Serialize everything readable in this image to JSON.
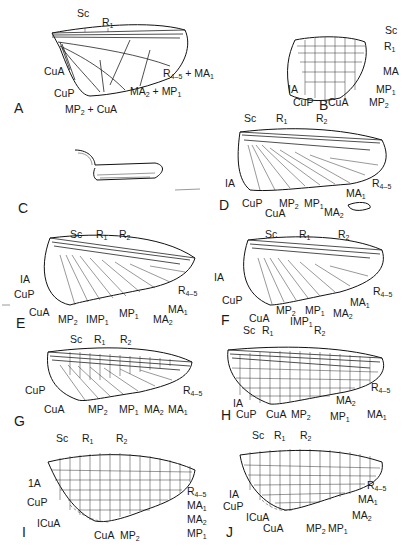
{
  "figure": {
    "panels": [
      {
        "id": "A",
        "letter": "A",
        "labels": [
          "Sc",
          "R1",
          "CuA",
          "CuP",
          "R4-5 + MA1",
          "MA2 + MP1",
          "MP2 + CuA"
        ]
      },
      {
        "id": "B",
        "letter": "B",
        "labels": [
          "Sc",
          "R1",
          "MA",
          "IA",
          "MP1",
          "CuP",
          "CuA",
          "MP2"
        ]
      },
      {
        "id": "C",
        "letter": "C",
        "labels": []
      },
      {
        "id": "D",
        "letter": "D",
        "labels": [
          "Sc",
          "R1",
          "R2",
          "IA",
          "R4-5",
          "MA1",
          "CuP",
          "MP2",
          "MP1",
          "MA2",
          "CuA"
        ]
      },
      {
        "id": "E",
        "letter": "E",
        "labels": [
          "Sc",
          "R1",
          "R2",
          "IA",
          "CuP",
          "R4-5",
          "MA1",
          "CuA",
          "MP2",
          "IMP1",
          "MP1",
          "MA2"
        ]
      },
      {
        "id": "F",
        "letter": "F",
        "labels": [
          "Sc",
          "R1",
          "R2",
          "IA",
          "CuP",
          "R4-5",
          "MA1",
          "CuA",
          "MP2",
          "MP1",
          "MA2",
          "IMP1"
        ]
      },
      {
        "id": "G",
        "letter": "G",
        "labels": [
          "Sc",
          "R1",
          "R2",
          "CuP",
          "R4-5",
          "CuA",
          "MP2",
          "MP1",
          "MA2",
          "MA1"
        ]
      },
      {
        "id": "H",
        "letter": "H",
        "labels": [
          "Sc",
          "R1",
          "R2",
          "R4-5",
          "IA",
          "CuP",
          "CuA",
          "MP2",
          "MA2",
          "MP1",
          "MA1"
        ]
      },
      {
        "id": "I",
        "letter": "I",
        "labels": [
          "Sc",
          "R1",
          "R2",
          "1A",
          "CuP",
          "ICuA",
          "CuA",
          "MP2",
          "R4-5",
          "MA1",
          "MA2",
          "MP1"
        ]
      },
      {
        "id": "J",
        "letter": "J",
        "labels": [
          "Sc",
          "R1",
          "R2",
          "IA",
          "CuP",
          "ICuA",
          "CuA",
          "MP2",
          "MP1",
          "R4-5",
          "MA1",
          "MA2"
        ]
      }
    ]
  },
  "t": {
    "Sc": "Sc",
    "R": "R",
    "one": "1",
    "two": "2",
    "fourfive": "4–5",
    "CuA": "CuA",
    "CuP": "CuP",
    "IA": "IA",
    "oneA": "1A",
    "ICuA": "ICuA",
    "MA": "MA",
    "MP": "MP",
    "IMP": "IMP",
    "plus": " + "
  },
  "letters": {
    "A": "A",
    "B": "B",
    "C": "C",
    "D": "D",
    "E": "E",
    "F": "F",
    "G": "G",
    "H": "H",
    "I": "I",
    "J": "J"
  }
}
